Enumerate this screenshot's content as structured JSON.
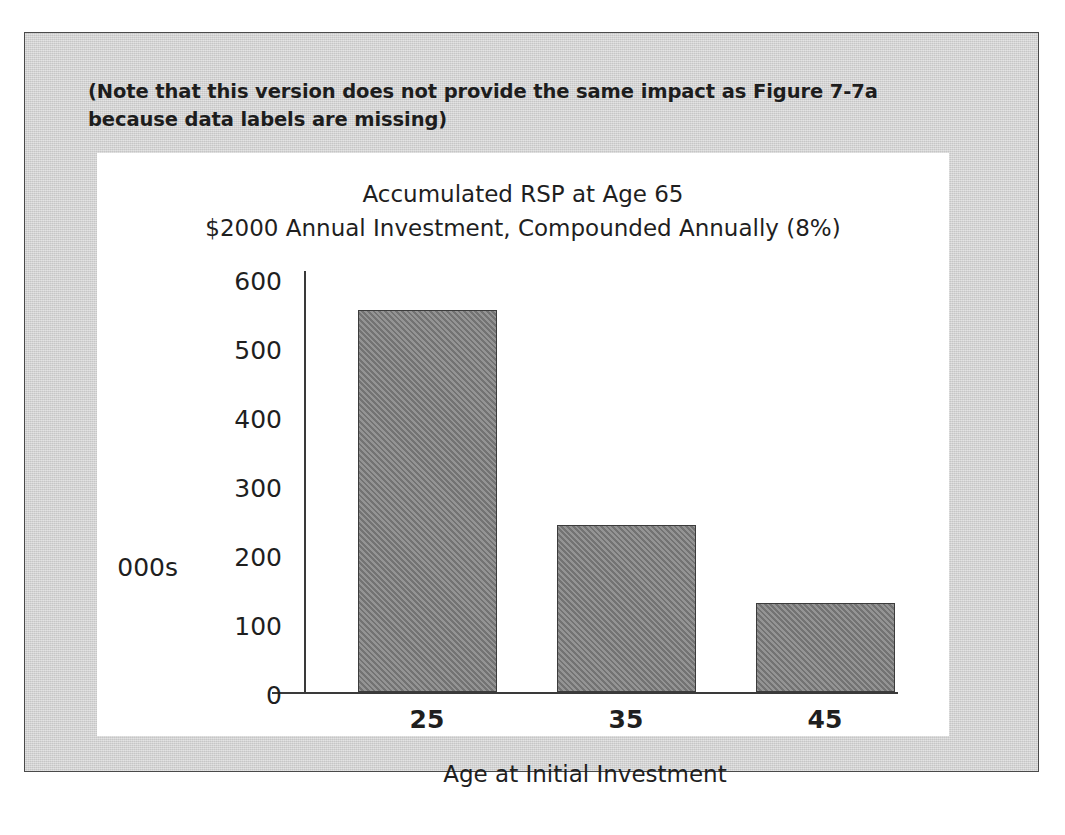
{
  "figure": {
    "note": "(Note that this version does not provide the same impact as Figure 7-7a because data labels are missing)",
    "frame_color": "#d2d2d2",
    "plate_color": "#ffffff",
    "border_color": "#4a4a4a"
  },
  "chart_data": {
    "type": "bar",
    "title": "Accumulated RSP at Age 65",
    "subtitle": "$2000 Annual Investment, Compounded Annually (8%)",
    "categories": [
      "25",
      "35",
      "45"
    ],
    "values": [
      552,
      241,
      128
    ],
    "xlabel": "Age at Initial Investment",
    "ylabel": "000s",
    "ylim": [
      0,
      600
    ],
    "yticks": [
      "0",
      "100",
      "200",
      "300",
      "400",
      "500",
      "600"
    ],
    "grid": false,
    "legend": "none",
    "bar_color": "#808080",
    "bar_border_color": "#3c3c3c",
    "axis_color": "#3a3a3a",
    "data_labels_shown": false
  }
}
